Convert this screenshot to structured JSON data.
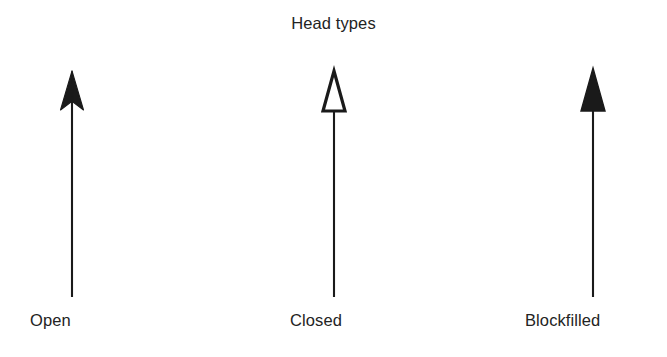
{
  "figure": {
    "title": "Head types",
    "background_color": "#ffffff",
    "ink_color": "#1a1a1a",
    "text_color": "#232323"
  },
  "arrows": [
    {
      "label": "Open",
      "head_style": "open",
      "head_description": "two thin barbs angled back from the tip, not closed",
      "head_filled": false,
      "direction": "up"
    },
    {
      "label": "Closed",
      "head_style": "closed",
      "head_description": "outlined triangle with white interior, closed at the base",
      "head_filled": false,
      "direction": "up"
    },
    {
      "label": "Blockfilled",
      "head_style": "blockfilled",
      "head_description": "solid black filled triangle",
      "head_filled": true,
      "direction": "up"
    }
  ]
}
